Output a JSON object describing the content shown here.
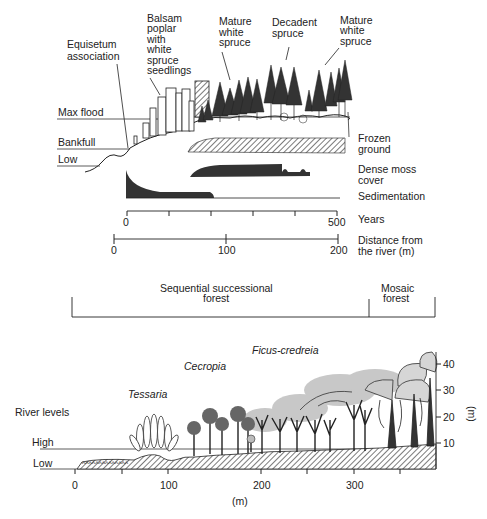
{
  "top_panel": {
    "annotations": {
      "equisetum": [
        "Equisetum",
        "association"
      ],
      "balsam": [
        "Balsam",
        "poplar",
        "with",
        "white",
        "spruce",
        "seedlings"
      ],
      "mature1": [
        "Mature",
        "white",
        "spruce"
      ],
      "decadent": [
        "Decadent",
        "spruce"
      ],
      "mature2": [
        "Mature",
        "white",
        "spruce"
      ]
    },
    "river_levels": {
      "max_flood": "Max flood",
      "bankfull": "Bankfull",
      "low": "Low"
    },
    "bands": {
      "frozen": [
        "Frozen",
        "ground"
      ],
      "moss": [
        "Dense moss",
        "cover"
      ],
      "sedimentation": "Sedimentation"
    },
    "years_axis": {
      "label": "Years",
      "start": "0",
      "end": "500"
    },
    "distance_axis": {
      "label": [
        "Distance from",
        "the river (m)"
      ],
      "ticks": [
        "0",
        "100",
        "200"
      ]
    }
  },
  "bracket": {
    "sequential": [
      "Sequential successional",
      "forest"
    ],
    "mosaic": [
      "Mosaic",
      "forest"
    ]
  },
  "bottom_panel": {
    "species": {
      "ficus": "Ficus-credreia",
      "cecropia": "Cecropia",
      "tessaria": "Tessaria"
    },
    "river_levels": {
      "title": "River levels",
      "high": "High",
      "low": "Low"
    },
    "x_axis": {
      "ticks": [
        "0",
        "100",
        "200",
        "300"
      ],
      "unit": "(m)"
    },
    "y_axis": {
      "ticks": [
        "10",
        "20",
        "30",
        "40"
      ],
      "unit": "(m)"
    }
  }
}
